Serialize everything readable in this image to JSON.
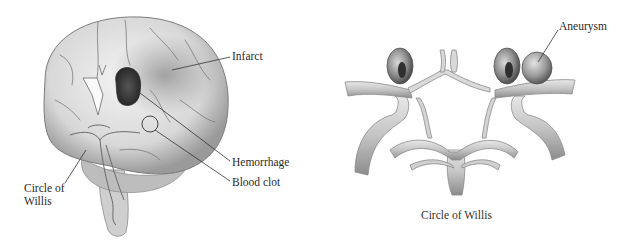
{
  "figure": {
    "left_panel": {
      "title": "Brain cross-section",
      "labels": {
        "infarct": "Infarct",
        "hemorrhage": "Hemorrhage",
        "blood_clot": "Blood clot",
        "circle_of_willis_line1": "Circle of",
        "circle_of_willis_line2": "Willis"
      }
    },
    "right_panel": {
      "labels": {
        "aneurysm": "Aneurysm"
      },
      "caption": "Circle of Willis"
    }
  }
}
